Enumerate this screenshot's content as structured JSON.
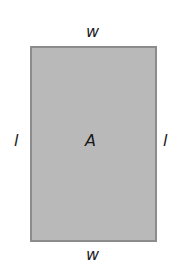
{
  "diagram": {
    "shape": "rectangle",
    "fill_color": "#b9b9b9",
    "border_color": "#8c8c8c",
    "labels": {
      "top": "w",
      "bottom": "w",
      "left": "l",
      "right": "l",
      "center": "A"
    }
  }
}
